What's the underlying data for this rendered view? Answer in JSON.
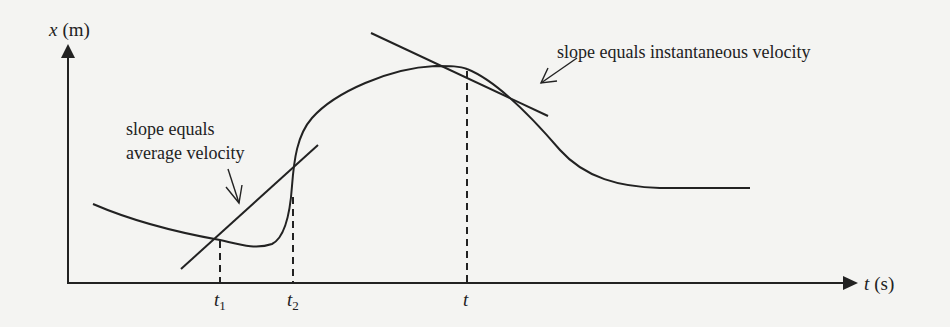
{
  "figure": {
    "type": "position-time graph",
    "y_axis": {
      "symbol": "x",
      "unit": "(m)"
    },
    "x_axis": {
      "symbol": "t",
      "unit": "(s)"
    },
    "ticks": [
      {
        "symbol": "t",
        "subscript": "1"
      },
      {
        "symbol": "t",
        "subscript": "2"
      },
      {
        "symbol": "t",
        "subscript": ""
      }
    ],
    "annotations": {
      "average": {
        "line1": "slope equals",
        "line2": "average velocity"
      },
      "instantaneous": {
        "text": "slope equals instantaneous velocity"
      }
    },
    "colors": {
      "ink": "#222222",
      "background": "#f4f4f2"
    }
  }
}
